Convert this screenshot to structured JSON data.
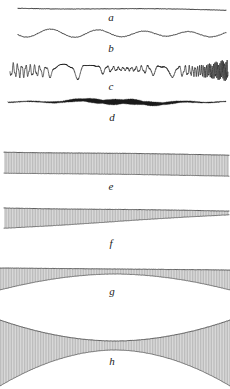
{
  "figure": {
    "kind": "multi-panel-trace-figure",
    "width": 230,
    "height": 389,
    "background_color": "#ffffff",
    "ink_color": "#1a1a1a",
    "band_fill_color": "#dcdcdc",
    "band_hatch_color": "#b4b4b4",
    "band_edge_color": "#555555",
    "panels": [
      {
        "label": "a",
        "label_x": 111,
        "label_y": 12,
        "kind": "straight-line",
        "description": "nearly straight horizontal trace, very faint slope",
        "x_start": 18,
        "x_end": 226,
        "baseline_y": 8,
        "amplitude": 0.6,
        "frequency": 1.0,
        "stroke_width": 0.9
      },
      {
        "label": "b",
        "label_x": 111,
        "label_y": 43,
        "kind": "low-frequency-wave",
        "description": "gentle undulating wavy trace, long wavelength",
        "x_start": 18,
        "x_end": 226,
        "baseline_y": 33,
        "amplitude": 3.2,
        "frequency": 9.0,
        "stroke_width": 0.9
      },
      {
        "label": "c",
        "label_x": 111,
        "label_y": 81,
        "kind": "high-frequency-oscillation",
        "description": "dense jagged high-frequency oscillation with modulated amplitude",
        "x_start": 10,
        "x_end": 228,
        "baseline_y": 70,
        "amplitude": 8.0,
        "frequency": 62.0,
        "stroke_width": 0.7
      },
      {
        "label": "d",
        "label_x": 112,
        "label_y": 112,
        "kind": "variable-thickness-trace",
        "description": "thin trace thickening into a dark blob across the middle",
        "x_start": 8,
        "x_end": 226,
        "baseline_y": 101,
        "amplitude": 1.6,
        "max_thickness": 5.0,
        "blob_center": 0.52,
        "stroke_width": 0.8
      },
      {
        "label": "e",
        "label_x": 111,
        "label_y": 181,
        "kind": "uniform-band",
        "description": "uniform-width hatched horizontal band, slight downward tilt",
        "x_start": 4,
        "x_end": 229,
        "top_left_y": 152,
        "top_right_y": 155,
        "bottom_left_y": 173,
        "bottom_right_y": 176,
        "thickness": 21
      },
      {
        "label": "f",
        "label_x": 111,
        "label_y": 238,
        "kind": "tapering-wedge-band",
        "description": "wedge band, thick at left tapering toward the right",
        "x_start": 4,
        "x_end": 229,
        "top_left_y": 208,
        "top_right_y": 211,
        "bottom_left_y": 228,
        "bottom_right_y": 232,
        "thickness_left": 20,
        "thickness_right": 4
      },
      {
        "label": "g",
        "label_x": 112,
        "label_y": 286,
        "kind": "arched-band",
        "description": "band with straight top edge and arched lower edge, thin at centre",
        "x_start": 0,
        "x_end": 230,
        "top_left_y": 268,
        "top_right_y": 270,
        "arch_edge_y": 290,
        "arch_apex_y": 274,
        "thickness_edge": 22,
        "thickness_centre": 5
      },
      {
        "label": "h",
        "label_x": 112,
        "label_y": 356,
        "kind": "hourglass-band",
        "description": "bowtie / hourglass band formed by two opposed curves pinching at centre",
        "x_start": 0,
        "x_end": 230,
        "upper_edge_left_y": 320,
        "upper_edge_centre_y": 341,
        "lower_edge_left_y": 386,
        "lower_edge_centre_y": 350,
        "waist_thickness": 9
      }
    ],
    "label_sequence": [
      "a",
      "b",
      "c",
      "d",
      "e",
      "f",
      "g",
      "h"
    ]
  }
}
